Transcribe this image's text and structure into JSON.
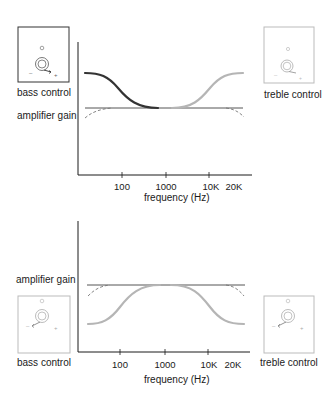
{
  "top_panel": {
    "left_control": {
      "label": "bass control",
      "knob_state": "boost"
    },
    "right_control": {
      "label": "treble control",
      "knob_state": "boost"
    },
    "y_label": "amplifier gain",
    "x_label": "frequency (Hz)",
    "ticks": [
      "100",
      "1000",
      "10K",
      "20K"
    ],
    "curves": {
      "flat": "flat response",
      "bass": "bass boost (dark)",
      "treble": "treble boost (light)",
      "dashed": "natural roll-off"
    }
  },
  "bottom_panel": {
    "left_control": {
      "label": "bass control",
      "knob_state": "cut"
    },
    "right_control": {
      "label": "treble control",
      "knob_state": "cut"
    },
    "y_label": "amplifier gain",
    "x_label": "frequency (Hz)",
    "ticks": [
      "100",
      "1000",
      "10K",
      "20K"
    ],
    "curves": {
      "flat": "flat response",
      "bass": "bass cut (light)",
      "treble": "treble cut (light)",
      "dashed": "natural roll-off"
    }
  },
  "colors": {
    "axis": "#1a1a1a",
    "dark_curve": "#333333",
    "light_curve": "#b5b5b5",
    "flat_line": "#555555",
    "box_dark": "#333333",
    "box_light": "#bbbbbb"
  }
}
